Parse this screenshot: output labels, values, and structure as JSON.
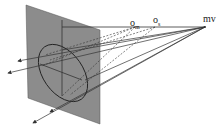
{
  "diagram": {
    "labels": {
      "mv": "mv",
      "om": "o",
      "om_sub": "m",
      "os": "o",
      "os_sub": "s"
    },
    "colors": {
      "plane": "#8c8c8c",
      "lines": "#333333",
      "background": "#ffffff"
    }
  }
}
